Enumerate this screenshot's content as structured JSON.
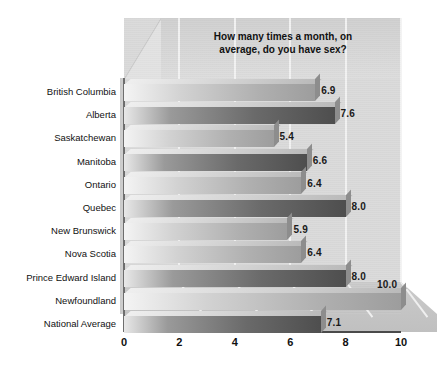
{
  "chart_data": {
    "type": "bar",
    "orientation": "horizontal",
    "title_lines": [
      "How many times a month, on",
      "average, do you have sex?"
    ],
    "xlabel": "",
    "ylabel": "",
    "xlim": [
      0,
      10
    ],
    "xticks": [
      "0",
      "2",
      "4",
      "6",
      "8",
      "10"
    ],
    "xtick_values": [
      0,
      2,
      4,
      6,
      8,
      10
    ],
    "grid": true,
    "legend": false,
    "style_3d": true,
    "categories": [
      "British Columbia",
      "Alberta",
      "Saskatchewan",
      "Manitoba",
      "Ontario",
      "Quebec",
      "New Brunswick",
      "Nova Scotia",
      "Prince Edward Island",
      "Newfoundland",
      "National Average"
    ],
    "values": [
      6.9,
      7.6,
      5.4,
      6.6,
      6.4,
      8.0,
      5.9,
      6.4,
      8.0,
      10.0,
      7.1
    ],
    "value_labels": [
      "6.9",
      "7.6",
      "5.4",
      "6.6",
      "6.4",
      "8.0",
      "5.9",
      "6.4",
      "8.0",
      "10.0",
      "7.1"
    ],
    "bar_shades": [
      "light",
      "dark",
      "light",
      "dark",
      "light",
      "dark",
      "light",
      "light",
      "dark",
      "light",
      "dark"
    ],
    "colors": {
      "background": "#ffffff",
      "wall": "#d9d9d9",
      "floor": "#c4c4c4",
      "gridline": "#f2f2f2",
      "axis": "#4a4a4a",
      "bar_dark": "#4e4e4e",
      "bar_light": "#b0b0b0",
      "text": "#111111"
    }
  }
}
